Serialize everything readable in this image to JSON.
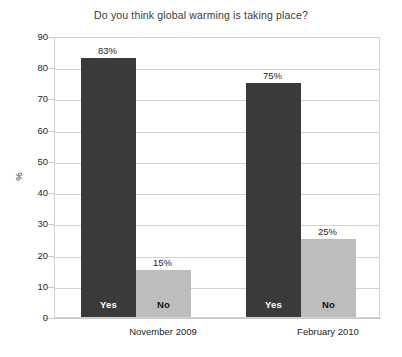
{
  "chart_data": {
    "type": "bar",
    "title": "Do you think global warming is taking place?",
    "xlabel": "",
    "ylabel": "%",
    "ylim": [
      0,
      90
    ],
    "yticks": [
      0,
      10,
      20,
      30,
      40,
      50,
      60,
      70,
      80,
      90
    ],
    "grid": true,
    "legend": "none",
    "categories": [
      "November 2009",
      "February 2010"
    ],
    "series": [
      {
        "name": "Yes",
        "values": [
          83,
          75
        ],
        "labels": [
          "83%",
          "75%"
        ],
        "color": "#3a3a3a",
        "inner_label_color": "#ffffff"
      },
      {
        "name": "No",
        "values": [
          15,
          25
        ],
        "labels": [
          "15%",
          "25%"
        ],
        "color": "#bdbdbd",
        "inner_label_color": "#111111"
      }
    ],
    "bars": [
      {
        "group": 0,
        "series": "Yes",
        "value": 83,
        "value_label": "83%",
        "inner_label": "Yes",
        "style": "dark",
        "left": 26,
        "width": 55
      },
      {
        "group": 0,
        "series": "No",
        "value": 15,
        "value_label": "15%",
        "inner_label": "No",
        "style": "light",
        "left": 81,
        "width": 55
      },
      {
        "group": 1,
        "series": "Yes",
        "value": 75,
        "value_label": "75%",
        "inner_label": "Yes",
        "style": "dark",
        "left": 191,
        "width": 55
      },
      {
        "group": 1,
        "series": "No",
        "value": 25,
        "value_label": "25%",
        "inner_label": "No",
        "style": "light",
        "left": 246,
        "width": 55
      }
    ],
    "category_positions": [
      109,
      274
    ],
    "axis_color": "#c9c9c9",
    "grid_color": "#d2d2d2",
    "background": "#ffffff"
  }
}
